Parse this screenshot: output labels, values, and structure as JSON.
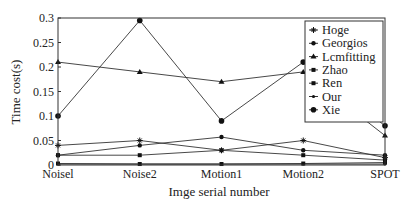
{
  "chart_data": {
    "type": "line",
    "title": "",
    "xlabel": "Imge serial number",
    "ylabel": "Time cost(s)",
    "categories": [
      "Noise1",
      "Noise2",
      "Motion1",
      "Motion2",
      "SPOT"
    ],
    "x_tick_labels": [
      "Noisel",
      "Noise2",
      "Motion1",
      "Motion2",
      "SPOT"
    ],
    "ylim": [
      0,
      0.3
    ],
    "y_ticks": [
      0,
      0.05,
      0.1,
      0.15,
      0.2,
      0.25,
      0.3
    ],
    "y_tick_labels": [
      "0",
      "0.05",
      "0.1",
      "0.15",
      "0.2",
      "0.25",
      "0.3"
    ],
    "grid": false,
    "legend_position": "upper right",
    "series": [
      {
        "name": "Hoge",
        "marker": "star",
        "values": [
          0.04,
          0.05,
          0.03,
          0.05,
          0.015
        ]
      },
      {
        "name": "Georgios",
        "marker": "dot",
        "values": [
          0.02,
          0.04,
          0.057,
          0.03,
          0.02
        ]
      },
      {
        "name": "Lcmfitting",
        "marker": "triangle",
        "values": [
          0.21,
          0.19,
          0.17,
          0.19,
          0.06
        ]
      },
      {
        "name": "Zhao",
        "marker": "square",
        "values": [
          0.02,
          0.02,
          0.03,
          0.02,
          0.01
        ]
      },
      {
        "name": "Ren",
        "marker": "square",
        "values": [
          0.003,
          0.002,
          0.002,
          0.003,
          0.005
        ]
      },
      {
        "name": "Our",
        "marker": "small-dot",
        "values": [
          0.002,
          0.002,
          0.002,
          0.002,
          0.002
        ]
      },
      {
        "name": "Xie",
        "marker": "big-dot",
        "values": [
          0.1,
          0.295,
          0.09,
          0.21,
          0.08
        ]
      }
    ]
  }
}
